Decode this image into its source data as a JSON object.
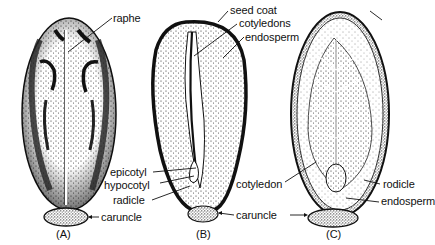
{
  "figure": {
    "panels": [
      {
        "id": "A",
        "caption": "(A)",
        "labels": {
          "raphe": "raphe",
          "caruncle": "caruncle"
        }
      },
      {
        "id": "B",
        "caption": "(B)",
        "labels": {
          "seed_coat": "seed coat",
          "cotyledons": "cotyledons",
          "endosperm": "endosperm",
          "epicotyl": "epicotyl",
          "hypocotyl": "hypocotyl",
          "radicle": "radicle",
          "caruncle": "caruncle"
        }
      },
      {
        "id": "C",
        "caption": "(C)",
        "labels": {
          "cotyledon": "cotyledon",
          "radicle": "rodicle",
          "endosperm": "endosperm"
        }
      }
    ]
  }
}
